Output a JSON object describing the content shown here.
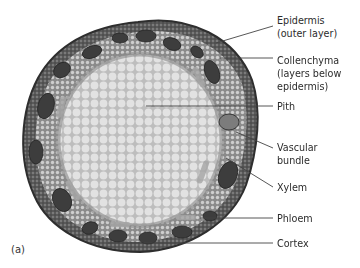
{
  "figure": {
    "panel_label": "(a)",
    "labels": [
      {
        "id": "epidermis",
        "text": "Epidermis\n(outer layer)"
      },
      {
        "id": "collenchyma",
        "text": "Collenchyma\n(layers below\nepidermis)"
      },
      {
        "id": "pith",
        "text": "Pith"
      },
      {
        "id": "vascular-bundle",
        "text": "Vascular\nbundle"
      },
      {
        "id": "xylem",
        "text": "Xylem"
      },
      {
        "id": "phloem",
        "text": "Phloem"
      },
      {
        "id": "cortex",
        "text": "Cortex"
      }
    ],
    "colors": {
      "background": "#ffffff",
      "outer_rind": "#4a4a4a",
      "cortex": "#8c8c8c",
      "bundle": "#3a3a3a",
      "pith": "#d9d9d9",
      "leader_line": "#444444",
      "text": "#2b2b2b"
    }
  }
}
